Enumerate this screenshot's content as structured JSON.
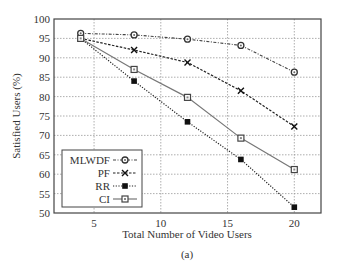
{
  "chart_data": {
    "type": "line",
    "title": "",
    "caption": "(a)",
    "xlabel": "Total Number of Video Users",
    "ylabel": "Satisfied Users (%)",
    "xlim": [
      2,
      22
    ],
    "ylim": [
      50,
      100
    ],
    "xticks": [
      5,
      10,
      15,
      20
    ],
    "yticks": [
      50,
      55,
      60,
      65,
      70,
      75,
      80,
      85,
      90,
      95,
      100
    ],
    "grid": true,
    "legend_position": "lower left",
    "x": [
      4,
      8,
      12,
      16,
      20
    ],
    "series": [
      {
        "name": "MLWDF",
        "values": [
          96.3,
          95.9,
          94.8,
          93.2,
          86.3
        ],
        "marker": "circle",
        "linestyle": "dash-dot"
      },
      {
        "name": "PF",
        "values": [
          95.0,
          92.0,
          88.8,
          81.5,
          72.3
        ],
        "marker": "x",
        "linestyle": "dashed"
      },
      {
        "name": "RR",
        "values": [
          95.0,
          84.0,
          73.5,
          63.8,
          51.5
        ],
        "marker": "filled-square",
        "linestyle": "dotted"
      },
      {
        "name": "CI",
        "values": [
          95.0,
          87.0,
          79.8,
          69.3,
          61.2
        ],
        "marker": "open-square",
        "linestyle": "solid"
      }
    ]
  }
}
